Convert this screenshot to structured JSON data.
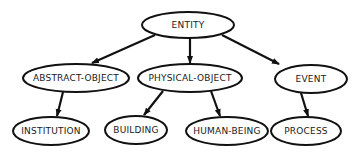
{
  "diagram": {
    "type": "hierarchy",
    "colors": {
      "stroke": "#111111",
      "fill": "#ffffff",
      "text": "#1a1a1a"
    },
    "nodes": [
      {
        "id": "entity",
        "label": "ENTITY",
        "cx": 188,
        "cy": 25,
        "rx": 46,
        "ry": 13
      },
      {
        "id": "abstract-object",
        "label": "ABSTRACT-OBJECT",
        "cx": 76,
        "cy": 78,
        "rx": 53,
        "ry": 14
      },
      {
        "id": "physical-object",
        "label": "PHYSICAL-OBJECT",
        "cx": 190,
        "cy": 78,
        "rx": 52,
        "ry": 14
      },
      {
        "id": "event",
        "label": "EVENT",
        "cx": 311,
        "cy": 79,
        "rx": 36,
        "ry": 14
      },
      {
        "id": "institution",
        "label": "INSTITUTION",
        "cx": 51,
        "cy": 131,
        "rx": 38,
        "ry": 14
      },
      {
        "id": "building",
        "label": "BUILDING",
        "cx": 136,
        "cy": 130,
        "rx": 31,
        "ry": 14
      },
      {
        "id": "human-being",
        "label": "HUMAN-BEING",
        "cx": 227,
        "cy": 131,
        "rx": 41,
        "ry": 14
      },
      {
        "id": "process",
        "label": "PROCESS",
        "cx": 306,
        "cy": 131,
        "rx": 35,
        "ry": 14
      }
    ],
    "edges": [
      {
        "from": "entity",
        "to": "abstract-object",
        "x1": 155,
        "y1": 35,
        "x2": 92,
        "y2": 63
      },
      {
        "from": "entity",
        "to": "physical-object",
        "x1": 190,
        "y1": 38,
        "x2": 190,
        "y2": 63
      },
      {
        "from": "entity",
        "to": "event",
        "x1": 222,
        "y1": 35,
        "x2": 279,
        "y2": 64
      },
      {
        "from": "abstract-object",
        "to": "institution",
        "x1": 63,
        "y1": 92,
        "x2": 57,
        "y2": 116
      },
      {
        "from": "physical-object",
        "to": "building",
        "x1": 163,
        "y1": 91,
        "x2": 144,
        "y2": 115
      },
      {
        "from": "physical-object",
        "to": "human-being",
        "x1": 211,
        "y1": 91,
        "x2": 220,
        "y2": 116
      },
      {
        "from": "event",
        "to": "process",
        "x1": 301,
        "y1": 93,
        "x2": 308,
        "y2": 116
      }
    ]
  }
}
